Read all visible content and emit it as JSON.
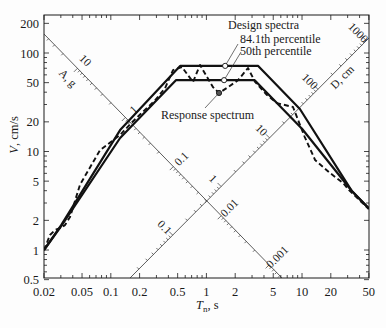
{
  "chart_data": {
    "type": "line",
    "title": "",
    "xlabel": {
      "symbol": "T",
      "subscript": "n",
      "unit": ", s"
    },
    "ylabel": {
      "symbol": "V",
      "unit": ", cm/s"
    },
    "xscale": "log",
    "yscale": "log",
    "xlim": [
      0.02,
      50
    ],
    "ylim": [
      0.5,
      243
    ],
    "grid": false,
    "xticks": [
      0.02,
      0.05,
      0.1,
      0.2,
      0.5,
      1,
      2,
      5,
      10,
      20,
      50
    ],
    "xtick_labels": [
      "0.02",
      "0.05",
      "0.1",
      "0.2",
      "0.5",
      "1",
      "2",
      "5",
      "10",
      "20",
      "50"
    ],
    "yticks": [
      0.5,
      1,
      2,
      5,
      10,
      20,
      50,
      100,
      200
    ],
    "ytick_labels": [
      "0.5",
      "1",
      "2",
      "5",
      "10",
      "20",
      "50",
      "100",
      "200"
    ],
    "diagonal_axes": [
      {
        "label": "A, g",
        "quantity": "pseudo-acceleration",
        "ticks": [
          10,
          1,
          0.1,
          0.01,
          0.001
        ],
        "tick_labels": [
          "10",
          "1",
          "0.1",
          "0.01",
          "0.001"
        ]
      },
      {
        "label": "D, cm",
        "quantity": "deformation",
        "ticks": [
          0.1,
          1,
          10,
          100,
          1000
        ],
        "tick_labels": [
          "0.1",
          "1",
          "10",
          "100",
          "1000"
        ]
      }
    ],
    "series": [
      {
        "name": "Design spectrum - 84.1th percentile",
        "style": "solid",
        "x": [
          0.02,
          0.0303,
          0.125,
          0.53,
          3.48,
          9.5,
          33,
          50
        ],
        "y": [
          1.0,
          1.79,
          16.5,
          74,
          74,
          27,
          4.0,
          2.64
        ]
      },
      {
        "name": "Design spectrum - 50th percentile",
        "style": "solid",
        "x": [
          0.02,
          0.0303,
          0.125,
          0.48,
          3.2,
          10,
          33,
          50
        ],
        "y": [
          1.0,
          1.75,
          13.7,
          53,
          53,
          17,
          4.0,
          2.64
        ]
      },
      {
        "name": "Response spectrum",
        "style": "dashed",
        "x": [
          0.02,
          0.0231,
          0.0261,
          0.0294,
          0.0332,
          0.0374,
          0.0476,
          0.077,
          0.1,
          0.125,
          0.16,
          0.2,
          0.29,
          0.37,
          0.447,
          0.555,
          0.724,
          0.857,
          1.17,
          1.355,
          1.68,
          2.14,
          2.72,
          3.22,
          4.3,
          5.47,
          8.05,
          10.7,
          13.7,
          19.6,
          26.9,
          31,
          50
        ],
        "y": [
          1.0,
          1.42,
          1.6,
          1.67,
          1.79,
          2.16,
          4.6,
          10.3,
          12.5,
          14.7,
          19,
          23.5,
          33,
          44,
          67,
          72,
          50.8,
          75.5,
          45.2,
          39.3,
          45,
          53,
          70.5,
          51,
          37.5,
          31,
          28.3,
          14,
          8.2,
          6.05,
          4.79,
          4.06,
          2.6
        ]
      }
    ],
    "annotations": [
      {
        "text": "Design spectra"
      },
      {
        "text": "84.1th percentile",
        "points_to": "series.0",
        "at": [
          1.57,
          74
        ]
      },
      {
        "text": "50th percentile",
        "points_to": "series.1",
        "at": [
          1.53,
          53
        ]
      },
      {
        "text": "Response spectrum",
        "points_to": "series.2",
        "at": [
          1.355,
          39.3
        ]
      }
    ],
    "legend": {
      "position": "inline annotations"
    }
  }
}
